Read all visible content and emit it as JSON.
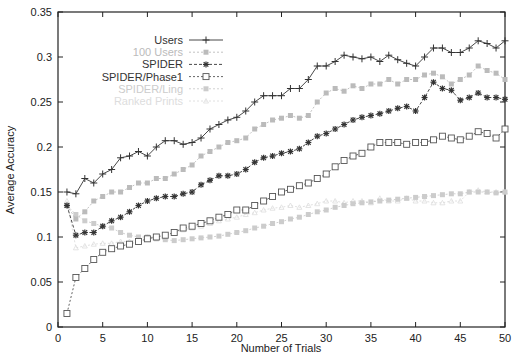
{
  "chart_data": {
    "type": "line",
    "title": "",
    "xlabel": "Number of Trials",
    "ylabel": "Average Accuracy",
    "xlim": [
      0,
      50
    ],
    "ylim": [
      0,
      0.35
    ],
    "xticks": [
      "0",
      "5",
      "10",
      "15",
      "20",
      "25",
      "30",
      "35",
      "40",
      "45",
      "50"
    ],
    "yticks": [
      "0",
      "0.05",
      "0.1",
      "0.15",
      "0.2",
      "0.25",
      "0.3",
      "0.35"
    ],
    "grid": false,
    "legend_position": "upper-left-inside",
    "x": [
      1,
      2,
      3,
      4,
      5,
      6,
      7,
      8,
      9,
      10,
      11,
      12,
      13,
      14,
      15,
      16,
      17,
      18,
      19,
      20,
      21,
      22,
      23,
      24,
      25,
      26,
      27,
      28,
      29,
      30,
      31,
      32,
      33,
      34,
      35,
      36,
      37,
      38,
      39,
      40,
      41,
      42,
      43,
      44,
      45,
      46,
      47,
      48,
      49,
      50
    ],
    "series": [
      {
        "name": "Users",
        "color": "#333333",
        "marker": "plus",
        "dash": "solid",
        "values": [
          0.15,
          0.148,
          0.165,
          0.16,
          0.17,
          0.175,
          0.188,
          0.19,
          0.195,
          0.19,
          0.2,
          0.207,
          0.207,
          0.203,
          0.205,
          0.21,
          0.22,
          0.225,
          0.23,
          0.233,
          0.24,
          0.25,
          0.257,
          0.257,
          0.257,
          0.265,
          0.265,
          0.275,
          0.29,
          0.29,
          0.295,
          0.302,
          0.3,
          0.298,
          0.3,
          0.295,
          0.302,
          0.297,
          0.293,
          0.29,
          0.3,
          0.31,
          0.31,
          0.305,
          0.305,
          0.31,
          0.318,
          0.315,
          0.31,
          0.318
        ]
      },
      {
        "name": "100 Users",
        "color": "#bbbbbb",
        "marker": "dot",
        "dash": "dotted",
        "values": [
          0.135,
          0.12,
          0.128,
          0.14,
          0.145,
          0.15,
          0.15,
          0.155,
          0.16,
          0.16,
          0.165,
          0.165,
          0.17,
          0.175,
          0.18,
          0.19,
          0.195,
          0.2,
          0.205,
          0.207,
          0.21,
          0.22,
          0.225,
          0.23,
          0.232,
          0.235,
          0.232,
          0.235,
          0.25,
          0.26,
          0.265,
          0.262,
          0.268,
          0.265,
          0.27,
          0.27,
          0.275,
          0.27,
          0.275,
          0.275,
          0.28,
          0.282,
          0.278,
          0.27,
          0.275,
          0.28,
          0.29,
          0.285,
          0.282,
          0.275
        ]
      },
      {
        "name": "SPIDER",
        "color": "#333333",
        "marker": "star",
        "dash": "dashed",
        "values": [
          0.135,
          0.102,
          0.105,
          0.105,
          0.112,
          0.118,
          0.122,
          0.128,
          0.135,
          0.14,
          0.143,
          0.145,
          0.145,
          0.148,
          0.15,
          0.158,
          0.163,
          0.168,
          0.168,
          0.17,
          0.175,
          0.183,
          0.188,
          0.19,
          0.193,
          0.195,
          0.198,
          0.205,
          0.212,
          0.215,
          0.22,
          0.225,
          0.23,
          0.233,
          0.235,
          0.237,
          0.24,
          0.243,
          0.245,
          0.24,
          0.255,
          0.272,
          0.265,
          0.263,
          0.252,
          0.255,
          0.26,
          0.255,
          0.255,
          0.253
        ]
      },
      {
        "name": "SPIDER/Phase1",
        "color": "#555555",
        "marker": "square",
        "dash": "dotted",
        "values": [
          0.015,
          0.055,
          0.065,
          0.075,
          0.083,
          0.087,
          0.09,
          0.092,
          0.095,
          0.098,
          0.1,
          0.102,
          0.105,
          0.11,
          0.112,
          0.115,
          0.118,
          0.122,
          0.125,
          0.13,
          0.13,
          0.135,
          0.14,
          0.145,
          0.15,
          0.153,
          0.157,
          0.16,
          0.165,
          0.17,
          0.178,
          0.185,
          0.19,
          0.193,
          0.2,
          0.205,
          0.205,
          0.205,
          0.203,
          0.205,
          0.205,
          0.208,
          0.212,
          0.21,
          0.208,
          0.212,
          0.217,
          0.215,
          0.21,
          0.22
        ]
      },
      {
        "name": "SPIDER/Ling",
        "color": "#cccccc",
        "marker": "dot",
        "dash": "dotted",
        "values": [
          0.135,
          0.125,
          0.118,
          0.115,
          0.112,
          0.11,
          0.105,
          0.102,
          0.1,
          0.1,
          0.098,
          0.097,
          0.096,
          0.097,
          0.098,
          0.099,
          0.1,
          0.101,
          0.103,
          0.105,
          0.107,
          0.11,
          0.112,
          0.115,
          0.117,
          0.12,
          0.122,
          0.125,
          0.128,
          0.13,
          0.133,
          0.135,
          0.137,
          0.138,
          0.139,
          0.14,
          0.141,
          0.142,
          0.143,
          0.144,
          0.145,
          0.146,
          0.147,
          0.148,
          0.148,
          0.15,
          0.15,
          0.15,
          0.149,
          0.15
        ]
      },
      {
        "name": "Ranked Prints",
        "color": "#dddddd",
        "marker": "triangle",
        "dash": "dotted",
        "values": [
          0.14,
          0.088,
          0.09,
          0.092,
          0.093,
          0.093,
          0.095,
          0.095,
          0.097,
          0.1,
          0.1,
          0.102,
          0.105,
          0.108,
          0.11,
          0.112,
          0.115,
          0.118,
          0.12,
          0.122,
          0.125,
          0.127,
          0.13,
          0.132,
          0.133,
          0.135,
          0.133,
          0.135,
          0.137,
          0.14,
          0.14,
          0.138,
          0.14,
          0.14,
          0.138,
          0.143,
          0.14,
          0.14,
          0.143,
          0.14,
          0.14,
          0.138,
          0.138,
          0.14,
          0.14,
          0.15,
          0.152,
          0.15,
          0.15,
          0.15
        ]
      }
    ]
  }
}
